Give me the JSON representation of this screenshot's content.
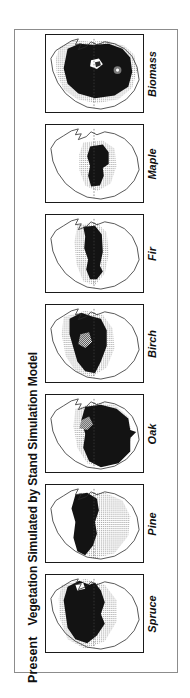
{
  "figure": {
    "title_left_bold": "Present",
    "title_right": "Vegetation Simulated by Stand Simulation Model",
    "frame_color": "#8c8c8c",
    "panel_border_color": "#1a1a1a",
    "background_color": "#ffffff"
  },
  "legend_tones": {
    "dense_color": "#131313",
    "moderate_color": "#6e6e6e",
    "sparse_color": "#c8c8c8",
    "absent_color": "#ffffff"
  },
  "panels": [
    {
      "label": "Biomass",
      "order": 1,
      "dense_cover_fraction": 0.62,
      "sparse_cover_fraction": 0.24,
      "notes": "broadest dark extent spanning most of the region"
    },
    {
      "label": "Maple",
      "order": 2,
      "dense_cover_fraction": 0.14,
      "sparse_cover_fraction": 0.26,
      "notes": "narrow central-south dark core"
    },
    {
      "label": "Fir",
      "order": 3,
      "dense_cover_fraction": 0.22,
      "sparse_cover_fraction": 0.2,
      "notes": "narrow north-south dark band through the centre"
    },
    {
      "label": "Birch",
      "order": 4,
      "dense_cover_fraction": 0.34,
      "sparse_cover_fraction": 0.22,
      "notes": "dark band widened to the west"
    },
    {
      "label": "Oak",
      "order": 5,
      "dense_cover_fraction": 0.45,
      "sparse_cover_fraction": 0.14,
      "notes": "dense dark mass occupying the eastern half"
    },
    {
      "label": "Pine",
      "order": 6,
      "dense_cover_fraction": 0.26,
      "sparse_cover_fraction": 0.34,
      "notes": "dark crescent on the west with wide light grey to the east"
    },
    {
      "label": "Spruce",
      "order": 7,
      "dense_cover_fraction": 0.4,
      "sparse_cover_fraction": 0.16,
      "notes": "large dark mass on the western/central area"
    }
  ]
}
